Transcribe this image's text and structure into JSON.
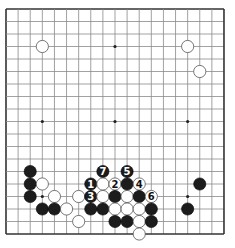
{
  "board": {
    "size": 19,
    "origin": [
      6,
      9
    ],
    "spacing": [
      12.11,
      12.5
    ],
    "line_color": "#8a8a8a",
    "border_color": "#333333",
    "stone_radius": 6.1,
    "star_points": [
      [
        3,
        3
      ],
      [
        9,
        3
      ],
      [
        15,
        3
      ],
      [
        3,
        9
      ],
      [
        9,
        9
      ],
      [
        15,
        9
      ],
      [
        3,
        15
      ],
      [
        9,
        15
      ],
      [
        15,
        15
      ]
    ],
    "stones": [
      {
        "c": 3,
        "r": 3,
        "color": "white"
      },
      {
        "c": 15,
        "r": 3,
        "color": "white"
      },
      {
        "c": 16,
        "r": 5,
        "color": "white"
      },
      {
        "c": 2,
        "r": 13,
        "color": "black"
      },
      {
        "c": 2,
        "r": 14,
        "color": "black"
      },
      {
        "c": 3,
        "r": 14,
        "color": "white"
      },
      {
        "c": 2,
        "r": 15,
        "color": "black"
      },
      {
        "c": 4,
        "r": 15,
        "color": "white"
      },
      {
        "c": 6,
        "r": 15,
        "color": "white"
      },
      {
        "c": 3,
        "r": 16,
        "color": "black"
      },
      {
        "c": 4,
        "r": 16,
        "color": "black"
      },
      {
        "c": 5,
        "r": 16,
        "color": "white"
      },
      {
        "c": 6,
        "r": 17,
        "color": "white"
      },
      {
        "c": 8,
        "r": 13,
        "color": "black",
        "label": "7"
      },
      {
        "c": 10,
        "r": 13,
        "color": "black",
        "label": "5"
      },
      {
        "c": 7,
        "r": 14,
        "color": "black",
        "label": "1"
      },
      {
        "c": 8,
        "r": 14,
        "color": "white"
      },
      {
        "c": 9,
        "r": 14,
        "color": "white",
        "label": "2"
      },
      {
        "c": 10,
        "r": 14,
        "color": "black"
      },
      {
        "c": 11,
        "r": 14,
        "color": "white",
        "label": "4"
      },
      {
        "c": 7,
        "r": 15,
        "color": "black",
        "label": "3"
      },
      {
        "c": 8,
        "r": 15,
        "color": "white"
      },
      {
        "c": 9,
        "r": 15,
        "color": "black"
      },
      {
        "c": 10,
        "r": 15,
        "color": "white"
      },
      {
        "c": 11,
        "r": 15,
        "color": "black"
      },
      {
        "c": 12,
        "r": 15,
        "color": "white",
        "label": "6"
      },
      {
        "c": 7,
        "r": 16,
        "color": "black"
      },
      {
        "c": 8,
        "r": 16,
        "color": "black"
      },
      {
        "c": 9,
        "r": 16,
        "color": "white"
      },
      {
        "c": 10,
        "r": 16,
        "color": "white"
      },
      {
        "c": 11,
        "r": 16,
        "color": "white"
      },
      {
        "c": 12,
        "r": 16,
        "color": "black"
      },
      {
        "c": 9,
        "r": 17,
        "color": "black"
      },
      {
        "c": 10,
        "r": 17,
        "color": "black"
      },
      {
        "c": 11,
        "r": 17,
        "color": "white"
      },
      {
        "c": 12,
        "r": 17,
        "color": "black"
      },
      {
        "c": 11,
        "r": 18,
        "color": "white"
      },
      {
        "c": 16,
        "r": 14,
        "color": "black"
      },
      {
        "c": 15,
        "r": 16,
        "color": "black"
      }
    ]
  }
}
